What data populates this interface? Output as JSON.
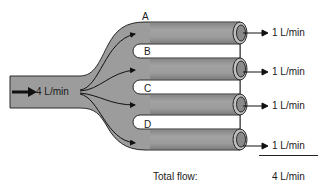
{
  "diagram": {
    "inlet": {
      "label": "4 L/min"
    },
    "branches": [
      {
        "id": "A",
        "outflow": "1 L/min"
      },
      {
        "id": "B",
        "outflow": "1 L/min"
      },
      {
        "id": "C",
        "outflow": "1 L/min"
      },
      {
        "id": "D",
        "outflow": "1 L/min"
      }
    ],
    "total": {
      "label": "Total flow:",
      "value": "4 L/min"
    },
    "colors": {
      "tube": "#9a9a9a",
      "tube_dark": "#5a5a5a",
      "outline": "#2a2a2a",
      "arrow": "#111111",
      "background": "#ffffff"
    }
  }
}
